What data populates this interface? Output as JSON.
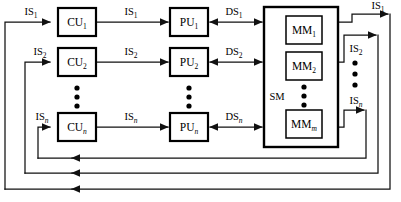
{
  "diagram": {
    "colors": {
      "line": "#111111",
      "box_border": "#000000",
      "background": "#ffffff"
    },
    "control_units": [
      {
        "label": "CU",
        "subscript": "1",
        "name": "control-unit-1"
      },
      {
        "label": "CU",
        "subscript": "2",
        "name": "control-unit-2"
      },
      {
        "label": "CU",
        "subscript": "n",
        "name": "control-unit-n"
      }
    ],
    "processing_units": [
      {
        "label": "PU",
        "subscript": "1",
        "name": "processing-unit-1"
      },
      {
        "label": "PU",
        "subscript": "2",
        "name": "processing-unit-2"
      },
      {
        "label": "PU",
        "subscript": "n",
        "name": "processing-unit-n"
      }
    ],
    "memory_modules": [
      {
        "label": "MM",
        "subscript": "1",
        "name": "memory-module-1"
      },
      {
        "label": "MM",
        "subscript": "2",
        "name": "memory-module-2"
      },
      {
        "label": "MM",
        "subscript": "m",
        "name": "memory-module-m"
      }
    ],
    "shared_memory": {
      "label": "SM",
      "name": "shared-memory-block"
    },
    "input_stream_labels_left": [
      {
        "label": "IS",
        "subscript": "1"
      },
      {
        "label": "IS",
        "subscript": "2"
      },
      {
        "label": "IS",
        "subscript": "n"
      }
    ],
    "input_stream_labels_middle": [
      {
        "label": "IS",
        "subscript": "1"
      },
      {
        "label": "IS",
        "subscript": "2"
      },
      {
        "label": "IS",
        "subscript": "n"
      }
    ],
    "data_stream_labels": [
      {
        "label": "DS",
        "subscript": "1"
      },
      {
        "label": "DS",
        "subscript": "2"
      },
      {
        "label": "DS",
        "subscript": "n"
      }
    ],
    "input_stream_labels_right": [
      {
        "label": "IS",
        "subscript": "1"
      },
      {
        "label": "IS",
        "subscript": "2"
      },
      {
        "label": "IS",
        "subscript": "n"
      }
    ],
    "vertical_ellipsis_count": 3
  }
}
